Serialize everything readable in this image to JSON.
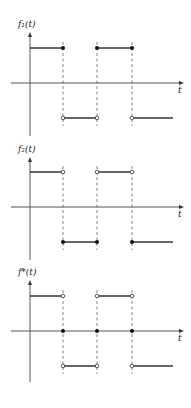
{
  "panels": [
    {
      "name": "f1",
      "ylabel": "f₁(t)",
      "xlabel": "t",
      "y_axis_x": 30,
      "y_top": 32,
      "y_bottom": 136,
      "axis_y": 83,
      "high_y": 48,
      "low_y": 118,
      "segments": [
        {
          "x1": 30,
          "x2": 63,
          "level": "high",
          "left_end": "none",
          "right_end": "closed"
        },
        {
          "x1": 63,
          "x2": 97,
          "level": "low",
          "left_end": "open",
          "right_end": "open"
        },
        {
          "x1": 97,
          "x2": 132,
          "level": "high",
          "left_end": "closed",
          "right_end": "closed"
        },
        {
          "x1": 132,
          "x2": 173,
          "level": "low",
          "left_end": "open",
          "right_end": "none"
        }
      ],
      "axis_points": []
    },
    {
      "name": "f2",
      "ylabel": "f₂(t)",
      "xlabel": "t",
      "y_axis_x": 30,
      "y_top": 157,
      "y_bottom": 260,
      "axis_y": 207,
      "high_y": 172,
      "low_y": 242,
      "segments": [
        {
          "x1": 30,
          "x2": 63,
          "level": "high",
          "left_end": "none",
          "right_end": "open"
        },
        {
          "x1": 63,
          "x2": 97,
          "level": "low",
          "left_end": "closed",
          "right_end": "closed"
        },
        {
          "x1": 97,
          "x2": 132,
          "level": "high",
          "left_end": "open",
          "right_end": "open"
        },
        {
          "x1": 132,
          "x2": 173,
          "level": "low",
          "left_end": "closed",
          "right_end": "none"
        }
      ],
      "axis_points": []
    },
    {
      "name": "fstar",
      "ylabel": "f*(t)",
      "xlabel": "t",
      "y_axis_x": 30,
      "y_top": 280,
      "y_bottom": 382,
      "axis_y": 331,
      "high_y": 296,
      "low_y": 366,
      "segments": [
        {
          "x1": 30,
          "x2": 63,
          "level": "high",
          "left_end": "none",
          "right_end": "open"
        },
        {
          "x1": 63,
          "x2": 97,
          "level": "low",
          "left_end": "open",
          "right_end": "open"
        },
        {
          "x1": 97,
          "x2": 132,
          "level": "high",
          "left_end": "open",
          "right_end": "open"
        },
        {
          "x1": 132,
          "x2": 173,
          "level": "low",
          "left_end": "open",
          "right_end": "none"
        }
      ],
      "axis_points": [
        63,
        97,
        132
      ]
    }
  ],
  "dashed_x": [
    63,
    97,
    132
  ],
  "axis_x_start": 11,
  "axis_x_end": 184
}
